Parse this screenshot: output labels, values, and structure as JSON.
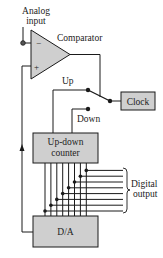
{
  "diagram": {
    "labels": {
      "analog_input_line1": "Analog",
      "analog_input_line2": "input",
      "comparator": "Comparator",
      "minus_sign": "−",
      "plus_sign": "+",
      "up": "Up",
      "down": "Down",
      "clock": "Clock",
      "counter_line1": "Up-down",
      "counter_line2": "counter",
      "digital_output_line1": "Digital",
      "digital_output_line2": "output",
      "dac": "D/A"
    },
    "bus_bits": 8,
    "colors": {
      "block_fill": "#cfcfcf",
      "stroke": "#1a1a1a",
      "background": "#ffffff"
    }
  }
}
